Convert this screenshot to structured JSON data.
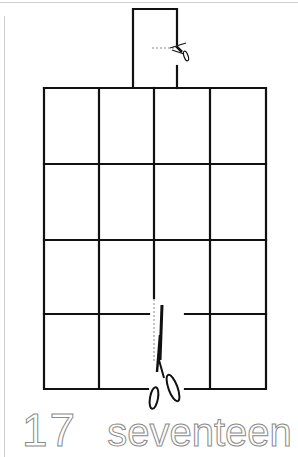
{
  "worksheet": {
    "number": "17",
    "word": "seventeen",
    "grid": {
      "rows": 4,
      "cols": 4
    },
    "colors": {
      "line": "#111111",
      "outline_text": "#8a8a8a",
      "page_edge": "#cfcfcf"
    },
    "icons": [
      "scissors-icon-top",
      "scissors-icon-bottom"
    ]
  }
}
